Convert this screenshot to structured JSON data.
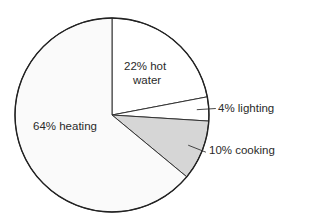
{
  "chart_data": {
    "type": "pie",
    "title": "",
    "slices": [
      {
        "label": "hot water",
        "value": 22,
        "text_line1": "22% hot",
        "text_line2": "water",
        "color": "#ffffff"
      },
      {
        "label": "lighting",
        "value": 4,
        "text": "4% lighting",
        "color": "#ffffff"
      },
      {
        "label": "cooking",
        "value": 10,
        "text": "10% cooking",
        "color": "#d6d6d6"
      },
      {
        "label": "heating",
        "value": 64,
        "text": "64% heating",
        "color": "#fafafa"
      }
    ],
    "start_angle_deg": 0,
    "direction": "clockwise",
    "stroke_color": "#333333"
  }
}
